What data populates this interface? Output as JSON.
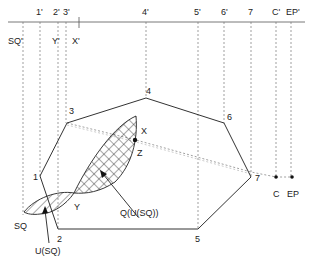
{
  "diagram": {
    "header_partial_text": "",
    "axis_labels": [
      {
        "id": "1p",
        "text": "1'",
        "x": 40
      },
      {
        "id": "2p",
        "text": "2'",
        "x": 56
      },
      {
        "id": "3p",
        "text": "3'",
        "x": 66
      },
      {
        "id": "4p",
        "text": "4'",
        "x": 146
      },
      {
        "id": "5p",
        "text": "5'",
        "x": 198
      },
      {
        "id": "6p",
        "text": "6'",
        "x": 224
      },
      {
        "id": "7p",
        "text": "7",
        "x": 251
      },
      {
        "id": "Cp",
        "text": "C'",
        "x": 276
      },
      {
        "id": "EPp",
        "text": "EP'",
        "x": 291
      }
    ],
    "projection_labels": [
      {
        "id": "SQp",
        "text": "SQ'",
        "x": 23
      },
      {
        "id": "Yp",
        "text": "Y'",
        "x": 58
      },
      {
        "id": "Xp",
        "text": "X'",
        "x": 74
      }
    ],
    "polygon_vertices": [
      {
        "label": "1",
        "x": 40,
        "y": 176
      },
      {
        "label": "3",
        "x": 67,
        "y": 123
      },
      {
        "label": "4",
        "x": 146,
        "y": 98
      },
      {
        "label": "6",
        "x": 224,
        "y": 123
      },
      {
        "label": "7",
        "x": 251,
        "y": 177
      },
      {
        "label": "5",
        "x": 198,
        "y": 229
      },
      {
        "label": "2",
        "x": 58,
        "y": 229
      }
    ],
    "points": [
      {
        "label": "X",
        "x": 136,
        "y": 128
      },
      {
        "label": "Z",
        "x": 135,
        "y": 140
      },
      {
        "label": "Y",
        "x": 74,
        "y": 193
      },
      {
        "label": "C",
        "x": 276,
        "y": 177
      },
      {
        "label": "EP",
        "x": 292,
        "y": 177
      }
    ],
    "regions": [
      {
        "label": "SQ",
        "pattern": "hatched"
      },
      {
        "label": "Q(U(SQ))",
        "pattern": "crosshatched"
      }
    ],
    "annotations": [
      {
        "text": "U(SQ)"
      },
      {
        "text": "Q(U(SQ))"
      }
    ]
  }
}
